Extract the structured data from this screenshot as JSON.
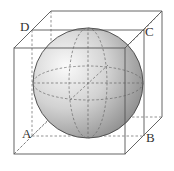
{
  "figure": {
    "labels": {
      "A": "A",
      "B": "B",
      "C": "C",
      "D": "D"
    },
    "colors": {
      "edge": "#555555",
      "hidden_edge": "#777777",
      "sphere_light": "#f4f4f4",
      "sphere_dark": "#8a8a8a",
      "sphere_outline": "#444444",
      "background": "#ffffff"
    }
  }
}
